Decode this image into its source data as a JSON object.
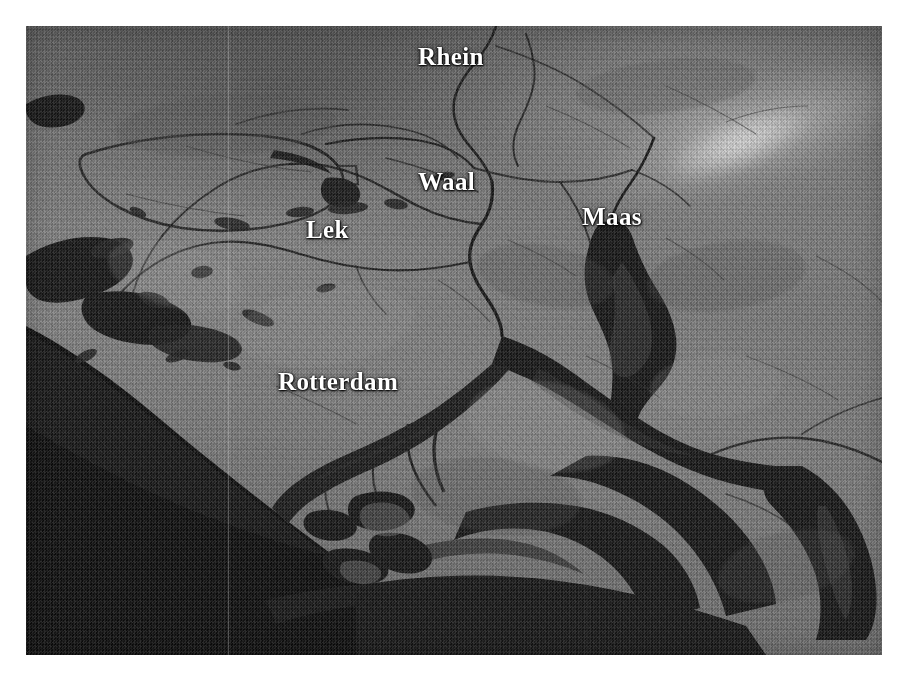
{
  "image": {
    "kind": "satellite-radar-photograph",
    "subject": "Rhine-Meuse delta, Netherlands",
    "palette": {
      "background": "#ffffff",
      "land_mid": "#787878",
      "land_dark": "#585858",
      "water": "#141414",
      "water_shallow": "#2a2a2a",
      "sea": "#0d0d0d",
      "label_color": "#ffffff",
      "label_shadow": "#000000",
      "haze_highlight": "#ebebeb"
    },
    "plate": {
      "left": 26,
      "top": 26,
      "width": 856,
      "height": 629
    }
  },
  "labels": [
    {
      "id": "rhein",
      "text": "Rhein",
      "type": "river",
      "x": 392,
      "y": 18
    },
    {
      "id": "waal",
      "text": "Waal",
      "type": "river",
      "x": 392,
      "y": 143
    },
    {
      "id": "lek",
      "text": "Lek",
      "type": "river",
      "x": 280,
      "y": 191
    },
    {
      "id": "maas",
      "text": "Maas",
      "type": "river",
      "x": 556,
      "y": 178
    },
    {
      "id": "rotterdam",
      "text": "Rotterdam",
      "type": "city",
      "x": 252,
      "y": 343
    }
  ],
  "features": {
    "sea_name": "North Sea",
    "sea_position": "lower-left",
    "coastline_orientation": "northeast-to-southwest diagonal",
    "river_count": 4,
    "city_count": 1
  }
}
